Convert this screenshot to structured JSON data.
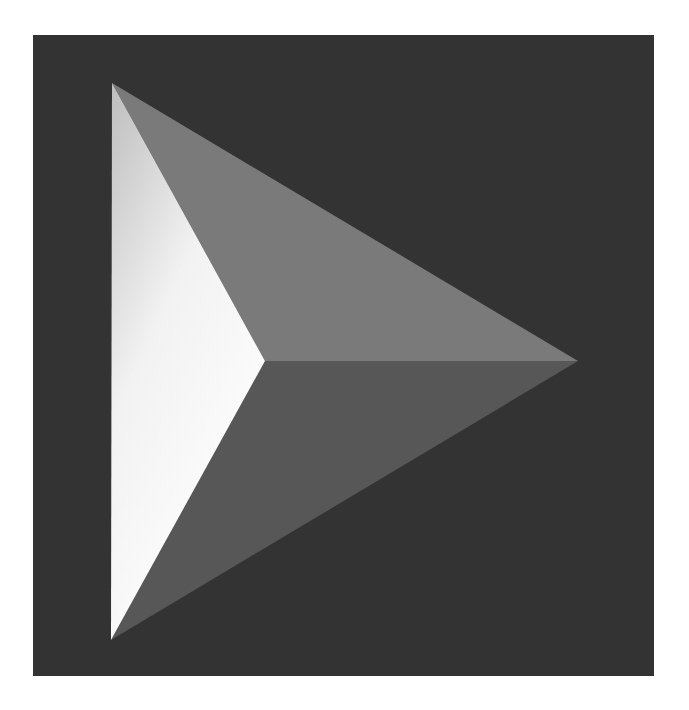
{
  "image": {
    "subject": "play-pyramid-icon",
    "colors": {
      "page_background": "#ffffff",
      "square_background": "#333333",
      "top_face": "#7a7a7a",
      "bottom_face": "#575757",
      "left_face_light": "#ffffff",
      "left_face_mid": "#c8c8c8"
    }
  }
}
